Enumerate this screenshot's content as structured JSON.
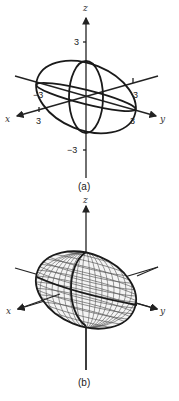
{
  "figure_a": {
    "caption": "(a)",
    "axes": {
      "x": "x",
      "y": "y",
      "z": "z"
    },
    "ticks": {
      "z_pos": "3",
      "z_neg": "−3",
      "x_pos": "3",
      "x_neg": "−3",
      "y_pos": "3",
      "y_neg": "3"
    }
  },
  "figure_b": {
    "caption": "(b)",
    "axes": {
      "x": "x",
      "y": "y",
      "z": "z"
    }
  }
}
